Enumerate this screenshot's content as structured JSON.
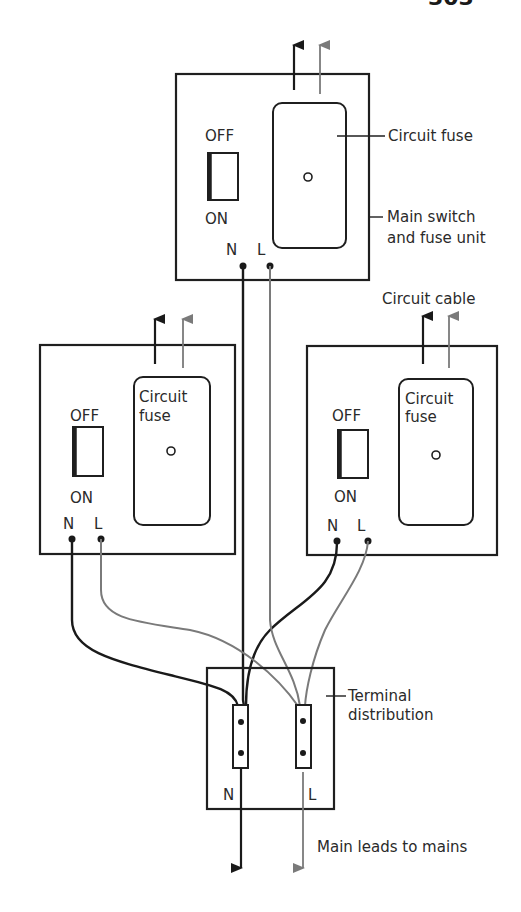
{
  "page": {
    "page_number": "303"
  },
  "colors": {
    "neutral_wire": "#1a1a1a",
    "live_wire": "#7a7a7a",
    "outline": "#1f1f1f",
    "background": "#ffffff"
  },
  "main_unit": {
    "switch_off_label": "OFF",
    "switch_on_label": "ON",
    "terminal_n_label": "N",
    "terminal_l_label": "L",
    "fuse_callout": "Circuit fuse",
    "unit_callout_line1": "Main switch",
    "unit_callout_line2": "and fuse unit"
  },
  "left_unit": {
    "switch_off_label": "OFF",
    "switch_on_label": "ON",
    "terminal_n_label": "N",
    "terminal_l_label": "L",
    "fuse_label_line1": "Circuit",
    "fuse_label_line2": "fuse"
  },
  "right_unit": {
    "switch_off_label": "OFF",
    "switch_on_label": "ON",
    "terminal_n_label": "N",
    "terminal_l_label": "L",
    "fuse_label_line1": "Circuit",
    "fuse_label_line2": "fuse",
    "cable_callout": "Circuit cable"
  },
  "terminal_block": {
    "callout_line1": "Terminal",
    "callout_line2": "distribution",
    "n_label": "N",
    "l_label": "L"
  },
  "mains": {
    "callout": "Main leads to mains"
  },
  "legend_icons": {
    "arrow": "arrow-up-icon",
    "terminal_dot": "terminal-dot-icon",
    "switch": "rocker-switch-icon"
  }
}
